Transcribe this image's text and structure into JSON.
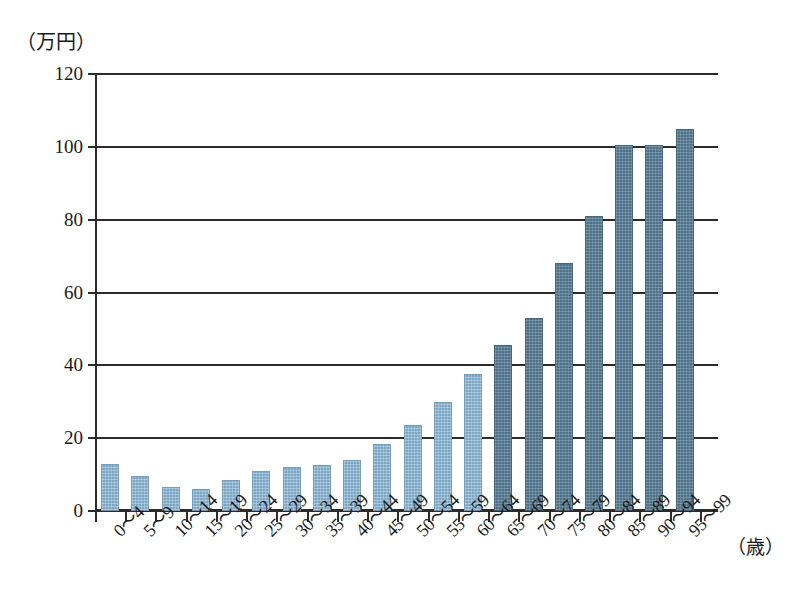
{
  "chart_data": {
    "type": "bar",
    "title": "",
    "subtitle": "",
    "ylabel": "（万円）",
    "xlabel": "（歳）",
    "categories": [
      "0〜4",
      "5〜9",
      "10〜14",
      "15〜19",
      "20〜24",
      "25〜29",
      "30〜34",
      "35〜39",
      "40〜44",
      "45〜49",
      "50〜54",
      "55〜59",
      "60〜64",
      "65〜69",
      "70〜74",
      "75〜79",
      "80〜84",
      "85〜89",
      "90〜94",
      "95〜99"
    ],
    "values": [
      13,
      9.5,
      6.5,
      6,
      8.5,
      11,
      12,
      12.5,
      14,
      18.5,
      23.5,
      30,
      37.5,
      45.5,
      53,
      68,
      81,
      100.5,
      100.5,
      105
    ],
    "series": [
      {
        "name": "一人当たり医療費",
        "values": [
          13,
          9.5,
          6.5,
          6,
          8.5,
          11,
          12,
          12.5,
          14,
          18.5,
          23.5,
          30,
          37.5,
          45.5,
          53,
          68,
          81,
          100.5,
          100.5,
          105
        ]
      }
    ],
    "bar_colors": [
      "light",
      "light",
      "light",
      "light",
      "light",
      "light",
      "light",
      "light",
      "light",
      "light",
      "light",
      "light",
      "light",
      "dark",
      "dark",
      "dark",
      "dark",
      "dark",
      "dark",
      "dark"
    ],
    "ylim": [
      0,
      120
    ],
    "yticks": [
      0,
      20,
      40,
      60,
      80,
      100,
      120
    ],
    "ytick_labels": [
      "0",
      "20",
      "40",
      "60",
      "80",
      "100",
      "120"
    ],
    "grid": true,
    "legend": "none",
    "colors": {
      "light_bar": "#7ba7c7",
      "dark_bar": "#4c7189",
      "axis": "#2b2b2b",
      "background": "#ffffff"
    }
  }
}
